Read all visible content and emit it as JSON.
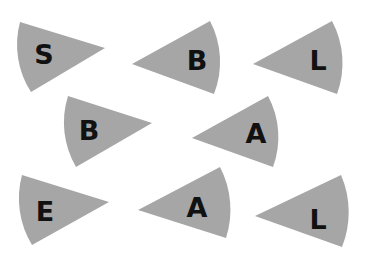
{
  "colors": {
    "background": "#ffffff",
    "wedge_fill": "#a6a6a6",
    "letter": "#111111"
  },
  "wedges": [
    {
      "letter": "S",
      "tip": [
        105,
        48
      ],
      "arc_start": [
        20,
        22
      ],
      "arc_end": [
        31,
        92
      ],
      "bulge": "left",
      "label_pos": [
        44,
        54
      ]
    },
    {
      "letter": "B",
      "tip": [
        132,
        64
      ],
      "arc_start": [
        210,
        21
      ],
      "arc_end": [
        214,
        94
      ],
      "bulge": "right",
      "label_pos": [
        197,
        60
      ]
    },
    {
      "letter": "L",
      "tip": [
        253,
        64
      ],
      "arc_start": [
        332,
        21
      ],
      "arc_end": [
        337,
        94
      ],
      "bulge": "right",
      "label_pos": [
        318,
        60
      ]
    },
    {
      "letter": "B",
      "tip": [
        152,
        123
      ],
      "arc_start": [
        68,
        96
      ],
      "arc_end": [
        76,
        167
      ],
      "bulge": "left",
      "label_pos": [
        89,
        130
      ]
    },
    {
      "letter": "A",
      "tip": [
        192,
        138
      ],
      "arc_start": [
        268,
        96
      ],
      "arc_end": [
        273,
        167
      ],
      "bulge": "right",
      "label_pos": [
        256,
        133
      ]
    },
    {
      "letter": "E",
      "tip": [
        109,
        202
      ],
      "arc_start": [
        22,
        175
      ],
      "arc_end": [
        32,
        245
      ],
      "bulge": "left",
      "label_pos": [
        45,
        211
      ]
    },
    {
      "letter": "A",
      "tip": [
        138,
        210
      ],
      "arc_start": [
        220,
        167
      ],
      "arc_end": [
        226,
        238
      ],
      "bulge": "right",
      "label_pos": [
        197,
        207
      ]
    },
    {
      "letter": "L",
      "tip": [
        255,
        216
      ],
      "arc_start": [
        341,
        175
      ],
      "arc_end": [
        342,
        247
      ],
      "bulge": "right",
      "label_pos": [
        318,
        219
      ]
    }
  ]
}
